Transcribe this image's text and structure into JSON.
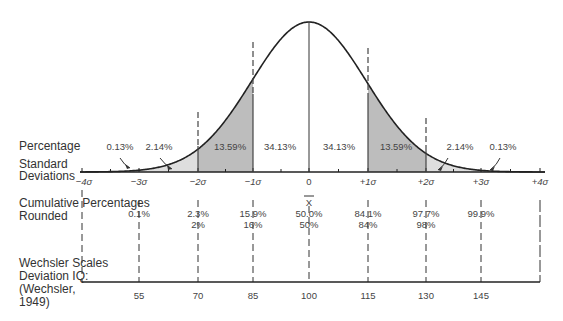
{
  "chart_data": {
    "type": "area",
    "distribution": "normal",
    "row_labels": {
      "percentage": "Percentage",
      "std_dev_1": "Standard",
      "std_dev_2": "Deviations",
      "cum_1": "Cumulative Percentages",
      "cum_2": "Rounded",
      "wechsler_1": "Wechsler Scales",
      "wechsler_2": "Deviation IQ:",
      "wechsler_3": "(Wechsler,",
      "wechsler_4": "1949)"
    },
    "segment_percentages": [
      "0.13%",
      "2.14%",
      "13.59%",
      "34.13%",
      "34.13%",
      "13.59%",
      "2.14%",
      "0.13%"
    ],
    "sigma_ticks": [
      "−4σ",
      "−3σ",
      "−2σ",
      "−1σ",
      "0",
      "+1σ",
      "+2σ",
      "+3σ",
      "+4σ"
    ],
    "mean_symbol": "X",
    "cumulative_percentages": [
      "0.1%",
      "2.3%",
      "15.9%",
      "50.0%",
      "84.1%",
      "97.7%",
      "99.9%"
    ],
    "cumulative_rounded": [
      "",
      "2%",
      "16%",
      "50%",
      "84%",
      "98%",
      ""
    ],
    "wechsler_iq": [
      "55",
      "70",
      "85",
      "100",
      "115",
      "130",
      "145"
    ],
    "shading": {
      "one_to_two_sigma": "#bdbdbd",
      "two_to_four_sigma": "#dedede"
    },
    "xlim": [
      -4,
      4
    ]
  }
}
